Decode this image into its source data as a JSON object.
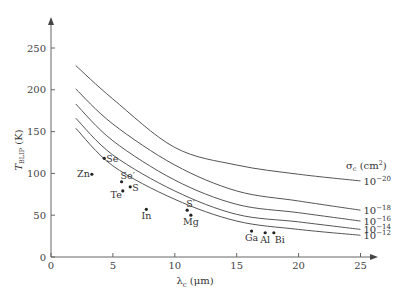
{
  "chart_data": {
    "type": "line",
    "title": "",
    "xlabel": "λc (μm)",
    "xlabel_main": "λ",
    "xlabel_sub": "c",
    "xlabel_unit": " (μm)",
    "ylabel_main": "T",
    "ylabel_sub": "BLIP",
    "ylabel_unit": " (K)",
    "xlim": [
      0,
      27
    ],
    "ylim": [
      0,
      280
    ],
    "xticks": [
      0,
      5,
      10,
      15,
      20,
      25
    ],
    "yticks": [
      0,
      50,
      100,
      150,
      200,
      250
    ],
    "legend_title": "σc (cm²)",
    "legend_title_main": "σ",
    "legend_title_sub": "c",
    "legend_title_unit": " (cm",
    "legend_title_sup": "2",
    "legend_title_close": ")",
    "legend_placement": "right",
    "x": [
      2,
      5,
      10,
      15,
      20,
      25
    ],
    "series": [
      {
        "name": "10^-20",
        "base": "10",
        "exp": "−20",
        "values": [
          229,
          189,
          131,
          110,
          99,
          91
        ]
      },
      {
        "name": "10^-18",
        "base": "10",
        "exp": "−18",
        "values": [
          201,
          159,
          110,
          79,
          67,
          56
        ]
      },
      {
        "name": "10^-16",
        "base": "10",
        "exp": "−16",
        "values": [
          183,
          139,
          92,
          63,
          53,
          43
        ]
      },
      {
        "name": "10^-14",
        "base": "10",
        "exp": "−14",
        "values": [
          166,
          122,
          79,
          51,
          42,
          33
        ]
      },
      {
        "name": "10^-12",
        "base": "10",
        "exp": "−12",
        "values": [
          154,
          109,
          69,
          43,
          33,
          26
        ]
      }
    ],
    "points": [
      {
        "label": "Se",
        "x": 4.3,
        "y": 118,
        "pos": "right"
      },
      {
        "label": "Zn",
        "x": 3.3,
        "y": 99,
        "pos": "left"
      },
      {
        "label": "Se′",
        "x": 5.7,
        "y": 90,
        "pos": "above-right"
      },
      {
        "label": "S",
        "x": 6.4,
        "y": 84,
        "pos": "right"
      },
      {
        "label": "Te",
        "x": 5.8,
        "y": 79,
        "pos": "below-left"
      },
      {
        "label": "In",
        "x": 7.7,
        "y": 57,
        "pos": "below"
      },
      {
        "label": "S′",
        "x": 11.0,
        "y": 56,
        "pos": "above-right"
      },
      {
        "label": "Mg",
        "x": 11.3,
        "y": 50,
        "pos": "below"
      },
      {
        "label": "Ga",
        "x": 16.2,
        "y": 31,
        "pos": "below"
      },
      {
        "label": "Al",
        "x": 17.3,
        "y": 29,
        "pos": "below"
      },
      {
        "label": "Bi",
        "x": 18.0,
        "y": 29,
        "pos": "below-right"
      }
    ]
  }
}
